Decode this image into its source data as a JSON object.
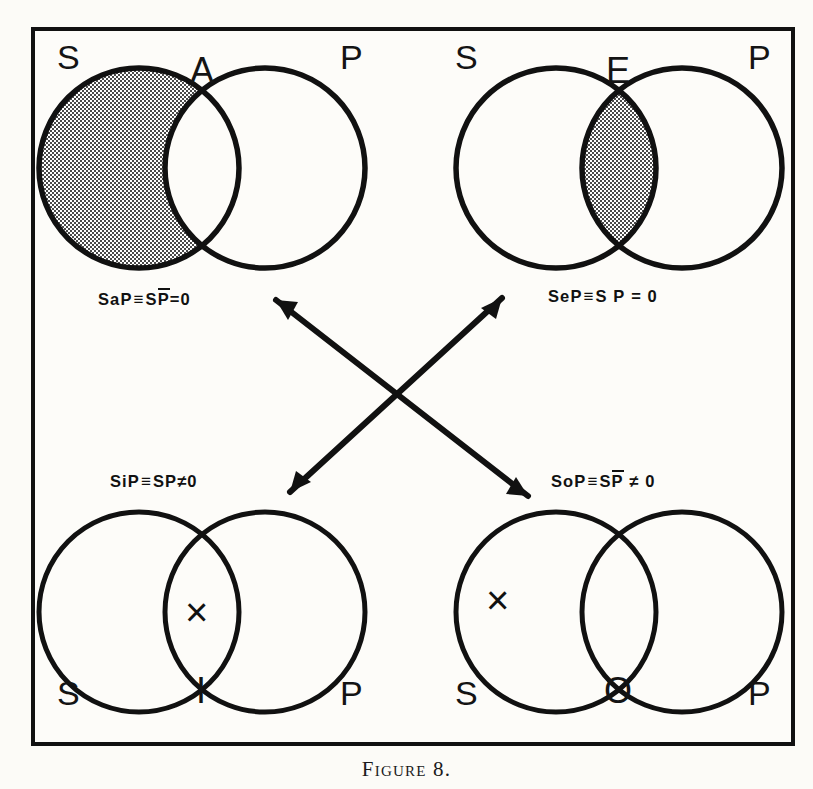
{
  "figure": {
    "caption": "Figure 8.",
    "frame_color": "#111111",
    "paper_color": "#fcfbf7",
    "ink_color": "#141414",
    "shade_color": "#8f8f8f"
  },
  "diagrams": [
    {
      "id": "A",
      "proposition_letter": "A",
      "left_label": "S",
      "right_label": "P",
      "position": "top-left",
      "formula": {
        "name": "SaP",
        "equivalence_sign": "≡",
        "expression": "SP̄",
        "relation": "=",
        "value": "0",
        "plain": "SaP ≡ SP̄ = 0",
        "overline_term": "P"
      },
      "shaded_region": "S-only",
      "x_mark_region": "none",
      "label_positions": {
        "proposition": "top-center",
        "left": "top-left",
        "right": "top-right"
      }
    },
    {
      "id": "E",
      "proposition_letter": "E",
      "left_label": "S",
      "right_label": "P",
      "position": "top-right",
      "formula": {
        "name": "SeP",
        "equivalence_sign": "≡",
        "expression": "S P",
        "relation": "=",
        "value": "0",
        "plain": "SeP ≡ S P = 0",
        "overline_term": ""
      },
      "shaded_region": "intersection",
      "x_mark_region": "none",
      "label_positions": {
        "proposition": "top-center",
        "left": "top-left",
        "right": "top-right"
      }
    },
    {
      "id": "I",
      "proposition_letter": "I",
      "left_label": "S",
      "right_label": "P",
      "position": "bottom-left",
      "formula": {
        "name": "SiP",
        "equivalence_sign": "≡",
        "expression": "SP",
        "relation": "≠",
        "value": "0",
        "plain": "SiP ≡ SP ≠ 0",
        "overline_term": ""
      },
      "shaded_region": "none",
      "x_mark_region": "intersection",
      "x_mark": "×",
      "label_positions": {
        "proposition": "bottom-center",
        "left": "bottom-left",
        "right": "bottom-right"
      }
    },
    {
      "id": "O",
      "proposition_letter": "O",
      "left_label": "S",
      "right_label": "P",
      "position": "bottom-right",
      "formula": {
        "name": "SoP",
        "equivalence_sign": "≡",
        "expression": "SP̄",
        "relation": "≠",
        "value": "0",
        "plain": "SoP ≡ SP̄ ≠ 0",
        "overline_term": "P"
      },
      "shaded_region": "none",
      "x_mark_region": "S-only",
      "x_mark": "×",
      "label_positions": {
        "proposition": "bottom-center",
        "left": "bottom-left",
        "right": "bottom-right"
      }
    }
  ],
  "arrows": [
    {
      "id": "A-O",
      "from": "A",
      "to": "O",
      "style": "double-headed",
      "direction": "top-left-to-bottom-right"
    },
    {
      "id": "E-I",
      "from": "E",
      "to": "I",
      "style": "double-headed",
      "direction": "top-right-to-bottom-left"
    }
  ],
  "formula_parts": {
    "a": {
      "name": "SaP",
      "eqv": "≡",
      "s": "S",
      "pbar": "P",
      "rel": "=",
      "zero": "0"
    },
    "e": {
      "name": "SeP",
      "eqv": "≡",
      "s": "S",
      "p": "P",
      "rel": "=",
      "zero": "0"
    },
    "i": {
      "name": "SiP",
      "eqv": "≡",
      "s": "S",
      "p": "P",
      "rel": "≠",
      "zero": "0"
    },
    "o": {
      "name": "SoP",
      "eqv": "≡",
      "s": "S",
      "pbar": "P",
      "rel": "≠",
      "zero": "0"
    }
  },
  "labels": {
    "S": "S",
    "P": "P",
    "A": "A",
    "E": "E",
    "I": "I",
    "O": "O",
    "x": "×"
  }
}
